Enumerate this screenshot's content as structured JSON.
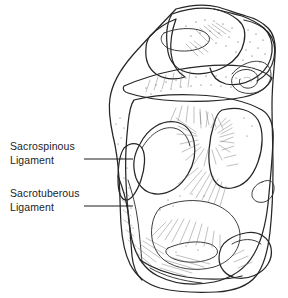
{
  "figure": {
    "background_color": "#ffffff",
    "ink_color": "#2b2b2b",
    "text_color": "#1d1d1d",
    "width": 288,
    "height": 298
  },
  "labels": [
    {
      "id": "sacrospinous",
      "name": "sacrospinous-ligament-label",
      "line1": "Sacrospinous",
      "line2": "Ligament",
      "leader": {
        "x1": 84,
        "y1": 159,
        "x2": 133,
        "y2": 159
      }
    },
    {
      "id": "sacrotuberous",
      "name": "sacrotuberous-ligament-label",
      "line1": "Sacrotuberous",
      "line2": "Ligament",
      "leader": {
        "x1": 84,
        "y1": 206,
        "x2": 133,
        "y2": 206
      }
    }
  ],
  "illustration": {
    "name": "pelvis-line-drawing",
    "description": "Black-and-white ink line drawing of the posterior pelvis showing the sacrum, ilium, ischial spine, ischial tuberosity, greater and lesser sciatic foramina, with stippled and hatched shading"
  }
}
